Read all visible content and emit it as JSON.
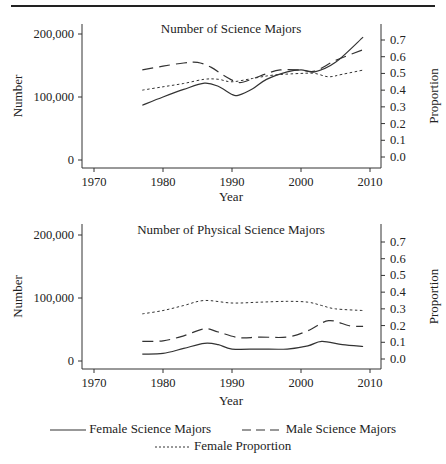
{
  "chart_data": [
    {
      "type": "line",
      "title": "Number of Science Majors",
      "xlabel": "Year",
      "ylabel": "Number",
      "ylabel_right": "Proportion",
      "xlim": [
        1968,
        2012
      ],
      "ylim": [
        -15000,
        215000
      ],
      "ylim_right": [
        0.0,
        0.7
      ],
      "xticks": [
        "1970",
        "1980",
        "1990",
        "2000",
        "2010"
      ],
      "yticks": [
        "0",
        "100,000",
        "200,000"
      ],
      "yticks_right": [
        "0.0",
        "0.1",
        "0.2",
        "0.3",
        "0.4",
        "0.5",
        "0.6",
        "0.7"
      ],
      "grid": false,
      "series": [
        {
          "name": "Female Science Majors",
          "axis": "left",
          "style": "solid",
          "x": [
            1977,
            1980,
            1983,
            1986,
            1988,
            1990,
            1991,
            1993,
            1995,
            1998,
            2000,
            2002,
            2005,
            2009
          ],
          "values": [
            87000,
            100000,
            112000,
            122000,
            117000,
            104000,
            103000,
            113000,
            128000,
            140000,
            143000,
            140000,
            155000,
            195000
          ]
        },
        {
          "name": "Male Science Majors",
          "axis": "left",
          "style": "dashed",
          "x": [
            1977,
            1980,
            1983,
            1985,
            1987,
            1989,
            1991,
            1993,
            1995,
            1997,
            2000,
            2002,
            2005,
            2009
          ],
          "values": [
            143000,
            149000,
            154000,
            155000,
            147000,
            133000,
            123000,
            129000,
            137000,
            143000,
            143000,
            141000,
            158000,
            175000
          ]
        },
        {
          "name": "Female Proportion",
          "axis": "right",
          "style": "dotted",
          "x": [
            1977,
            1980,
            1983,
            1986,
            1988,
            1990,
            1993,
            1996,
            2000,
            2002,
            2004,
            2006,
            2009
          ],
          "values": [
            0.4,
            0.42,
            0.44,
            0.465,
            0.465,
            0.45,
            0.47,
            0.49,
            0.5,
            0.5,
            0.48,
            0.495,
            0.52
          ]
        }
      ]
    },
    {
      "type": "line",
      "title": "Number of Physical Science Majors",
      "xlabel": "Year",
      "ylabel": "Number",
      "ylabel_right": "Proportion",
      "xlim": [
        1968,
        2012
      ],
      "ylim": [
        -15000,
        215000
      ],
      "ylim_right": [
        0.0,
        0.7
      ],
      "xticks": [
        "1970",
        "1980",
        "1990",
        "2000",
        "2010"
      ],
      "yticks": [
        "0",
        "100,000",
        "200,000"
      ],
      "yticks_right": [
        "0.0",
        "0.1",
        "0.2",
        "0.3",
        "0.4",
        "0.5",
        "0.6",
        "0.7"
      ],
      "grid": false,
      "series": [
        {
          "name": "Female Science Majors",
          "axis": "left",
          "style": "solid",
          "x": [
            1977,
            1980,
            1983,
            1986,
            1988,
            1990,
            1994,
            1998,
            2001,
            2003,
            2006,
            2009
          ],
          "values": [
            11000,
            12000,
            20000,
            28000,
            26000,
            19000,
            19000,
            19000,
            24000,
            31000,
            26000,
            23000
          ]
        },
        {
          "name": "Male Science Majors",
          "axis": "left",
          "style": "dashed",
          "x": [
            1977,
            1980,
            1983,
            1986,
            1988,
            1991,
            1994,
            1998,
            2001,
            2004,
            2007,
            2009
          ],
          "values": [
            31000,
            32000,
            40000,
            51000,
            46000,
            37000,
            38000,
            38000,
            48000,
            64000,
            56000,
            55000
          ]
        },
        {
          "name": "Female Proportion",
          "axis": "right",
          "style": "dotted",
          "x": [
            1977,
            1980,
            1983,
            1986,
            1990,
            1994,
            1998,
            2001,
            2003,
            2005,
            2009
          ],
          "values": [
            0.27,
            0.29,
            0.32,
            0.35,
            0.335,
            0.34,
            0.345,
            0.34,
            0.32,
            0.3,
            0.29
          ]
        }
      ]
    }
  ],
  "legend": {
    "items": [
      {
        "label": "Female Science Majors",
        "style": "solid"
      },
      {
        "label": "Male Science Majors",
        "style": "dashed"
      },
      {
        "label": "Female Proportion",
        "style": "dotted"
      }
    ]
  }
}
